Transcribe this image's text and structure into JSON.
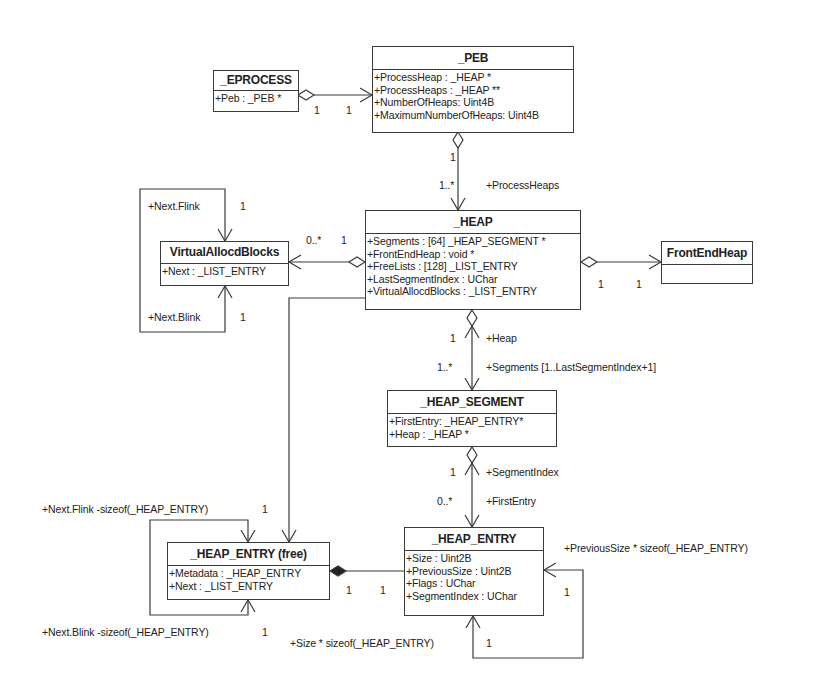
{
  "diagram": {
    "type": "uml-class-diagram",
    "colors": {
      "line": "#3a3a3a",
      "background": "#ffffff",
      "text": "#222222"
    },
    "classes": {
      "eprocess": {
        "name": "_EPROCESS",
        "attributes": [
          "+Peb : _PEB *"
        ]
      },
      "peb": {
        "name": "_PEB",
        "attributes": [
          "+ProcessHeap : _HEAP *",
          "+ProcessHeaps : _HEAP **",
          "+NumberOfHeaps: Uint4B",
          "+MaximumNumberOfHeaps: Uint4B"
        ]
      },
      "virtualallocdblocks": {
        "name": "VirtualAllocdBlocks",
        "attributes": [
          "+Next : _LIST_ENTRY"
        ]
      },
      "heap": {
        "name": "_HEAP",
        "attributes": [
          "+Segments : [64] _HEAP_SEGMENT *",
          "+FrontEndHeap : void *",
          "+FreeLists : [128] _LIST_ENTRY",
          "+LastSegmentIndex : UChar",
          "+VirtualAllocdBlocks : _LIST_ENTRY"
        ]
      },
      "frontendheap": {
        "name": "FrontEndHeap",
        "attributes": []
      },
      "heap_segment": {
        "name": "_HEAP_SEGMENT",
        "attributes": [
          "+FirstEntry: _HEAP_ENTRY*",
          "+Heap : _HEAP *"
        ]
      },
      "heap_entry": {
        "name": "_HEAP_ENTRY",
        "attributes": [
          "+Size : Uint2B",
          "+PreviousSize : Uint2B",
          "+Flags : UChar",
          "+SegmentIndex : UChar"
        ]
      },
      "heap_entry_free": {
        "name": "_HEAP_ENTRY (free)",
        "attributes": [
          "+Metadata : _HEAP_ENTRY",
          "+Next : _LIST_ENTRY"
        ]
      }
    },
    "labels": {
      "eprocess_peb_m1": "1",
      "eprocess_peb_m2": "1",
      "peb_heap_m1": "1",
      "peb_heap_m2": "1..*",
      "peb_heap_role": "+ProcessHeaps",
      "vab_flink_role": "+Next.Flink",
      "vab_flink_m": "1",
      "vab_blink_role": "+Next.Blink",
      "vab_blink_m": "1",
      "heap_vab_m1": "0..*",
      "heap_vab_m2": "1",
      "heap_feh_m1": "1",
      "heap_feh_m2": "1",
      "heap_seg_m1": "1",
      "heap_seg_role1": "+Heap",
      "heap_seg_m2": "1..*",
      "heap_seg_role2": "+Segments [1..LastSegmentIndex+1]",
      "seg_entry_m1": "1",
      "seg_entry_role1": "+SegmentIndex",
      "seg_entry_m2": "0..*",
      "seg_entry_role2": "+FirstEntry",
      "free_flink_role": "+Next.Flink -sizeof(_HEAP_ENTRY)",
      "free_flink_m": "1",
      "free_blink_role": "+Next.Blink -sizeof(_HEAP_ENTRY)",
      "free_blink_m": "1",
      "free_entry_m1": "1",
      "free_entry_m2": "1",
      "entry_prev_role": "+PreviousSize * sizeof(_HEAP_ENTRY)",
      "entry_prev_m": "1",
      "entry_size_role": "+Size * sizeof(_HEAP_ENTRY)",
      "entry_size_m": "1"
    }
  }
}
